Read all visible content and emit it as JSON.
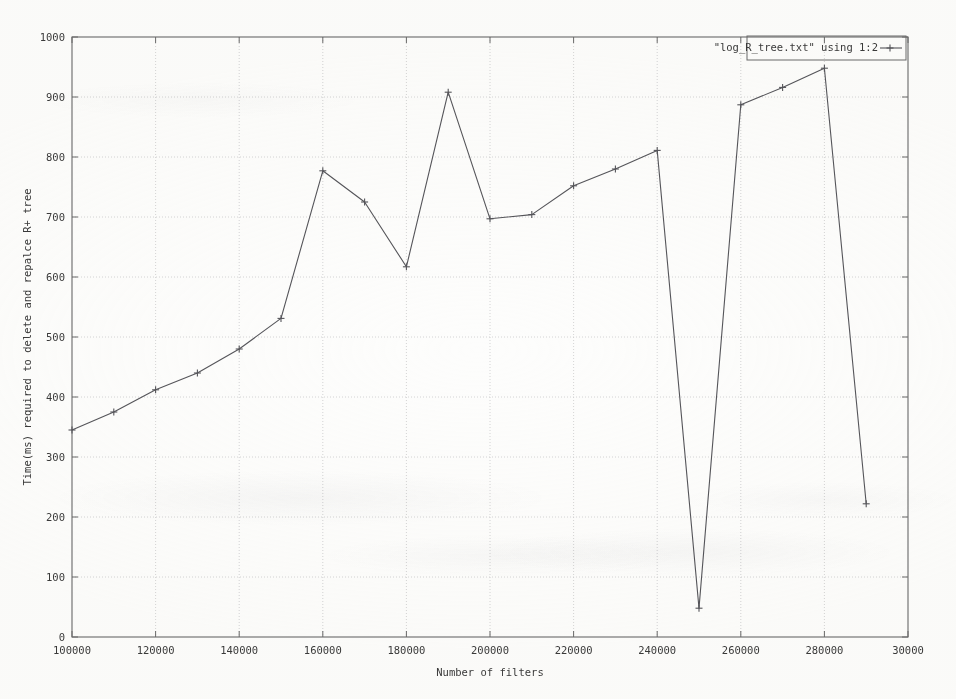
{
  "chart_data": {
    "type": "line",
    "title": "",
    "xlabel": "Number of filters",
    "ylabel": "Time(ms) required to delete and repalce R+ tree",
    "xlim": [
      100000,
      300000
    ],
    "ylim": [
      0,
      1000
    ],
    "grid": true,
    "legend_position": "top-right",
    "legend_entries": [
      "\"log_R_tree.txt\" using 1:2"
    ],
    "xticks": [
      100000,
      120000,
      140000,
      160000,
      180000,
      200000,
      220000,
      240000,
      260000,
      280000,
      300000
    ],
    "xtick_labels": [
      "100000",
      "120000",
      "140000",
      "160000",
      "180000",
      "200000",
      "220000",
      "240000",
      "260000",
      "280000",
      "30000"
    ],
    "yticks": [
      0,
      100,
      200,
      300,
      400,
      500,
      600,
      700,
      800,
      900,
      1000
    ],
    "ytick_labels": [
      "0",
      "100",
      "200",
      "300",
      "400",
      "500",
      "600",
      "700",
      "800",
      "900",
      "1000"
    ],
    "series": [
      {
        "name": "\"log_R_tree.txt\" using 1:2",
        "marker": "plus",
        "color": "#55555a",
        "x": [
          100000,
          110000,
          120000,
          130000,
          140000,
          150000,
          160000,
          170000,
          180000,
          190000,
          200000,
          210000,
          220000,
          230000,
          240000,
          250000,
          260000,
          270000,
          280000,
          290000
        ],
        "values": [
          345,
          375,
          412,
          440,
          480,
          531,
          777,
          725,
          617,
          908,
          697,
          704,
          752,
          780,
          811,
          48,
          887,
          916,
          948,
          222
        ]
      }
    ]
  },
  "plot": {
    "frame_color": "#6a6a6a",
    "grid_color": "#c9c9cc",
    "background": "#fdfdfc"
  }
}
